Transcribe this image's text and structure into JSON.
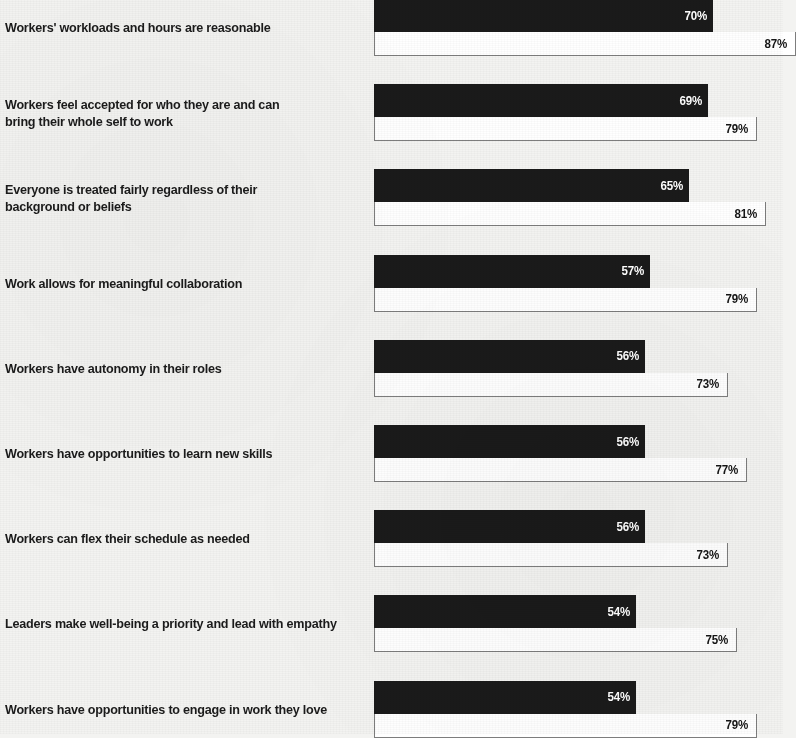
{
  "chart_data": {
    "type": "bar",
    "orientation": "horizontal",
    "title": "",
    "subtitle": "",
    "xlabel": "",
    "ylabel": "",
    "xlim": [
      0,
      100
    ],
    "grid": false,
    "legend_position": "none",
    "value_suffix": "%",
    "colors": {
      "series_1": "#1a1a1a",
      "series_2": "#ffffff",
      "series_2_border": "#7d7d7d",
      "background": "#f3f3f1",
      "label_text": "#1b1b1b"
    },
    "categories": [
      "Workers' workloads and hours are reasonable",
      "Workers feel accepted for who they are and can bring their whole self to work",
      "Everyone is treated fairly regardless of their background or beliefs",
      "Work allows for meaningful collaboration",
      "Workers have autonomy in their roles",
      "Workers have opportunities to learn new skills",
      "Workers can flex their schedule as needed",
      "Leaders make well-being a priority and lead with empathy",
      "Workers have opportunities to engage in work they love"
    ],
    "series": [
      {
        "name": "series-dark",
        "values": [
          70,
          69,
          65,
          57,
          56,
          56,
          56,
          54,
          54
        ],
        "labels": [
          "70%",
          "69%",
          "65%",
          "57%",
          "56%",
          "56%",
          "56%",
          "54%",
          "54%"
        ]
      },
      {
        "name": "series-light",
        "values": [
          87,
          79,
          81,
          79,
          73,
          77,
          73,
          75,
          79
        ],
        "labels": [
          "87%",
          "79%",
          "81%",
          "79%",
          "73%",
          "77%",
          "73%",
          "75%",
          "79%"
        ]
      }
    ]
  },
  "rows": [
    {
      "label_line_1": "Workers' workloads and hours are reasonable",
      "label_line_2": "",
      "dark_label": "70%",
      "light_label": "87%",
      "dark_value": 70,
      "light_value": 87
    },
    {
      "label_line_1": "Workers feel accepted for who they are and can",
      "label_line_2": "bring their whole self to work",
      "dark_label": "69%",
      "light_label": "79%",
      "dark_value": 69,
      "light_value": 79
    },
    {
      "label_line_1": "Everyone is treated fairly regardless of their",
      "label_line_2": "background or beliefs",
      "dark_label": "65%",
      "light_label": "81%",
      "dark_value": 65,
      "light_value": 81
    },
    {
      "label_line_1": "Work allows for meaningful collaboration",
      "label_line_2": "",
      "dark_label": "57%",
      "light_label": "79%",
      "dark_value": 57,
      "light_value": 79
    },
    {
      "label_line_1": "Workers have autonomy in their roles",
      "label_line_2": "",
      "dark_label": "56%",
      "light_label": "73%",
      "dark_value": 56,
      "light_value": 73
    },
    {
      "label_line_1": "Workers have opportunities to learn new skills",
      "label_line_2": "",
      "dark_label": "56%",
      "light_label": "77%",
      "dark_value": 56,
      "light_value": 77
    },
    {
      "label_line_1": "Workers can flex their schedule as needed",
      "label_line_2": "",
      "dark_label": "56%",
      "light_label": "73%",
      "dark_value": 56,
      "light_value": 73
    },
    {
      "label_line_1": "Leaders make well-being a priority and lead with empathy",
      "label_line_2": "",
      "dark_label": "54%",
      "light_label": "75%",
      "dark_value": 54,
      "light_value": 75
    },
    {
      "label_line_1": "Workers have opportunities to engage in work they love",
      "label_line_2": "",
      "dark_label": "54%",
      "light_label": "79%",
      "dark_value": 54,
      "light_value": 79
    }
  ]
}
